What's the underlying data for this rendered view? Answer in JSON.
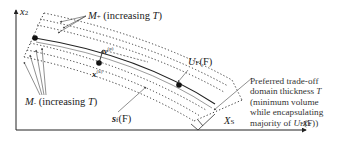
{
  "diagram": {
    "axes": {
      "x_label": "x",
      "x_sub": "1",
      "y_label": "x",
      "y_sub": "2"
    },
    "labels": {
      "m_plus": {
        "symbol": "M",
        "sub": "+",
        "text": " (increasing ",
        "var": "T",
        "close": ")"
      },
      "m_minus": {
        "symbol": "M",
        "sub": "-",
        "text": " (increasing ",
        "var": "T",
        "close": ")"
      },
      "v_p": {
        "symbol": "v",
        "sup": "(p)"
      },
      "x_k": {
        "symbol": "x",
        "sup": "(k)"
      },
      "u_f": {
        "symbol": "U",
        "sub": "F",
        "arg": "(F)"
      },
      "s_f": {
        "symbol": "s",
        "sub": "f",
        "arg": "(F)"
      },
      "x_s": {
        "symbol": "X",
        "sub": "S"
      }
    },
    "annotation": {
      "lines": [
        "Preferred trade-off",
        "domain thickness T",
        "(minimum volume",
        "while encapsulating",
        "majority of U_F(F))"
      ],
      "line1": "Preferred trade-off",
      "line2_text": "domain thickness ",
      "line2_var": "T",
      "line3": "(minimum volume",
      "line4": "while encapsulating",
      "line5_text": "majority of ",
      "line5_sym": "U",
      "line5_sub": "F",
      "line5_end": "(F))"
    },
    "colors": {
      "line": "#222222",
      "dots": "#333333",
      "background": "#ffffff"
    }
  }
}
